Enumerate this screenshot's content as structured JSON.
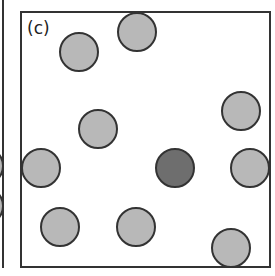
{
  "panel": {
    "label": "(c)",
    "frame": {
      "x": 21,
      "y": 12,
      "width": 249,
      "height": 255,
      "stroke": "#333333"
    },
    "colors": {
      "light": "#b8b8b8",
      "dark": "#6e6e6e",
      "stroke": "#333333"
    }
  },
  "circles": [
    {
      "cx": 79,
      "cy": 52,
      "r": 19,
      "shade": "light"
    },
    {
      "cx": 137,
      "cy": 32,
      "r": 19,
      "shade": "light"
    },
    {
      "cx": 241,
      "cy": 111,
      "r": 19,
      "shade": "light"
    },
    {
      "cx": 98,
      "cy": 129,
      "r": 19,
      "shade": "light"
    },
    {
      "cx": 41,
      "cy": 168,
      "r": 19,
      "shade": "light"
    },
    {
      "cx": 175,
      "cy": 168,
      "r": 19,
      "shade": "dark"
    },
    {
      "cx": 250,
      "cy": 168,
      "r": 19,
      "shade": "light"
    },
    {
      "cx": 60,
      "cy": 227,
      "r": 19,
      "shade": "light"
    },
    {
      "cx": 136,
      "cy": 227,
      "r": 19,
      "shade": "light"
    },
    {
      "cx": 231,
      "cy": 248,
      "r": 19,
      "shade": "light"
    }
  ],
  "neighbor_panel": {
    "edge_x": 3,
    "partial_circles": [
      {
        "cx": -16,
        "cy": 166,
        "r": 19
      },
      {
        "cx": -16,
        "cy": 206,
        "r": 19
      }
    ]
  }
}
